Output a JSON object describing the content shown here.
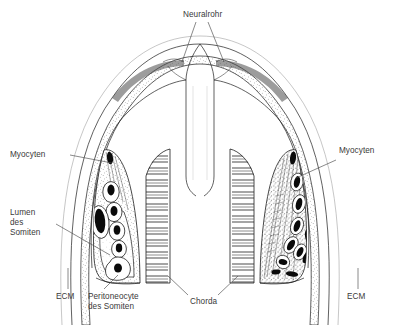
{
  "figure": {
    "title_text": "",
    "type": "anatomical-cross-section",
    "language": "de",
    "background_color": "#ffffff",
    "ink_color": "#1d1d1d",
    "label_color": "#3a3a3a",
    "nucleus_color": "#0a0a0a"
  },
  "labels": {
    "neural_tube": "Neuralrohr",
    "myocytes_left": "Myocyten",
    "myocytes_right": "Myocyten",
    "lumen_somite": "Lumen\ndes\nSomiten",
    "ecm_left": "ECM",
    "ecm_right": "ECM",
    "peritoneocyte": "Peritoneocyte\ndes Somiten",
    "chorda": "Chorda"
  },
  "structures": [
    {
      "name": "neuralrohr",
      "label": "Neuralrohr",
      "description": "central vertical neural tube channel"
    },
    {
      "name": "chorda",
      "label": "Chorda",
      "description": "notochord, horizontally hatched paired halves"
    },
    {
      "name": "somite-left",
      "label": "Lumen des Somiten",
      "description": "left somite with rounded undifferentiated myocytes"
    },
    {
      "name": "somite-right",
      "label": "Myocyten",
      "description": "right somite with elongated differentiated myocytes"
    },
    {
      "name": "ecm",
      "label": "ECM",
      "description": "extracellular matrix stippled layer"
    },
    {
      "name": "peritoneocyte",
      "label": "Peritoneocyte des Somiten",
      "description": "peritoneal cell lining ventral somite"
    }
  ]
}
